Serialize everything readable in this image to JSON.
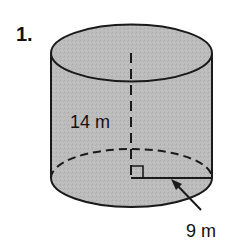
{
  "problem": {
    "number": "1.",
    "shape": "cylinder",
    "height_label": "14 m",
    "radius_label": "9 m",
    "height_value": 14,
    "radius_value": 9,
    "unit": "m"
  },
  "colors": {
    "fill": "#b9b9b9",
    "outline": "#1a1a1a",
    "background": "#ffffff"
  }
}
